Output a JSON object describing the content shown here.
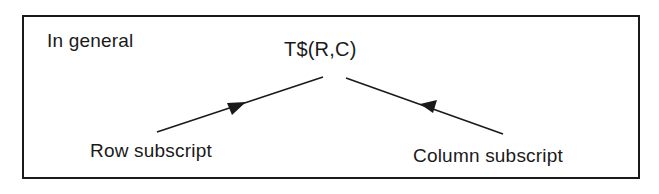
{
  "diagram": {
    "heading": "In general",
    "expression": "T$(R,C)",
    "annotations": [
      {
        "label": "Row subscript",
        "points_to": "R"
      },
      {
        "label": "Column subscript",
        "points_to": "C"
      }
    ],
    "colors": {
      "ink": "#1a1a1a",
      "background": "#ffffff"
    }
  }
}
